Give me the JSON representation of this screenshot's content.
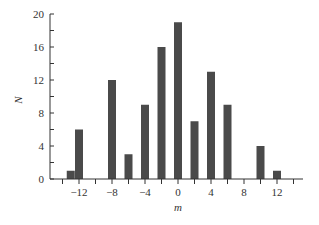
{
  "chart_data": {
    "type": "bar",
    "title": "",
    "xlabel": "m",
    "ylabel": "N",
    "x": [
      -13,
      -12,
      -8,
      -6,
      -4,
      -2,
      0,
      2,
      4,
      6,
      10,
      12
    ],
    "values": [
      1,
      6,
      12,
      3,
      9,
      16,
      19,
      7,
      13,
      9,
      4,
      1
    ],
    "xlim": [
      -15,
      15
    ],
    "ylim": [
      0,
      20
    ],
    "x_ticks": [
      -14,
      -12,
      -10,
      -8,
      -6,
      -4,
      -2,
      0,
      2,
      4,
      6,
      8,
      10,
      12,
      14
    ],
    "x_tick_labels": [
      "-12",
      "-8",
      "-4",
      "0",
      "4",
      "8",
      "12"
    ],
    "x_tick_label_values": [
      -12,
      -8,
      -4,
      0,
      4,
      8,
      12
    ],
    "y_ticks": [
      0,
      2,
      4,
      6,
      8,
      10,
      12,
      14,
      16,
      18,
      20
    ],
    "y_tick_labels": [
      "0",
      "4",
      "8",
      "12",
      "16",
      "20"
    ],
    "y_tick_label_values": [
      0,
      4,
      8,
      12,
      16,
      20
    ],
    "grid": false,
    "legend": null,
    "bar_color": "#4a4a4a",
    "axis_color": "#333333"
  }
}
